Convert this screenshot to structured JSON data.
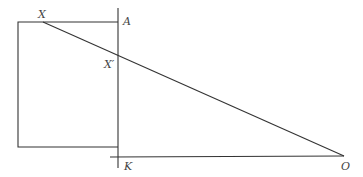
{
  "diagram": {
    "type": "geometry",
    "labels": {
      "X": "X",
      "A": "A",
      "X_prime": "X′",
      "K": "K",
      "O": "O"
    },
    "points": {
      "X": [
        43,
        22
      ],
      "A": [
        118,
        22
      ],
      "X_prime": [
        118,
        54
      ],
      "K": [
        118,
        157
      ],
      "O": [
        344,
        156
      ]
    },
    "colors": {
      "line": "#333333",
      "label": "#444444",
      "background": "#ffffff"
    }
  }
}
